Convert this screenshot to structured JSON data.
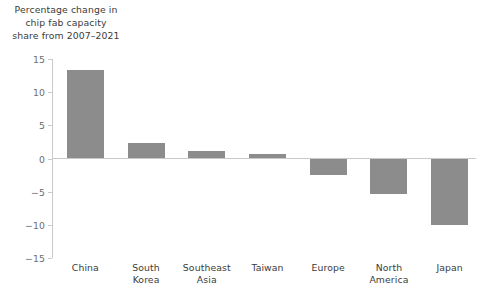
{
  "chart_data": {
    "type": "bar",
    "title": "Percentage change in\nchip fab capacity\nshare from 2007–2021",
    "xlabel": "",
    "ylabel": "",
    "categories": [
      "China",
      "South\nKorea",
      "Southeast\nAsia",
      "Taiwan",
      "Europe",
      "North\nAmerica",
      "Japan"
    ],
    "values": [
      13.3,
      2.4,
      1.2,
      0.7,
      -2.5,
      -5.3,
      -10.0
    ],
    "ylim": [
      -15,
      15
    ],
    "yticks": [
      15,
      10,
      5,
      0,
      -5,
      -10,
      -15
    ],
    "ytick_labels": [
      "15",
      "10",
      "5",
      "0",
      "−5",
      "−10",
      "−15"
    ],
    "grid": false,
    "legend": null,
    "bar_color": "#8c8c8c",
    "axis_color": "#c9c9c9",
    "text_color": "#3b3b3b",
    "tick_label_color": "#6e6e6e"
  }
}
